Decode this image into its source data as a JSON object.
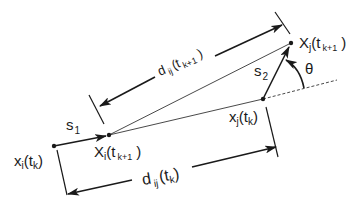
{
  "diagram": {
    "colors": {
      "stroke": "#1a1a1a",
      "background": "#ffffff"
    },
    "points": {
      "xi_tk": {
        "label_main": "x",
        "label_sub": "i",
        "label_arg": "(t",
        "label_arg_sub": "k",
        "label_close": ")"
      },
      "Xi_tk1": {
        "label_main": "X",
        "label_sub": "i",
        "label_arg": "(t",
        "label_arg_sub": "k+1",
        "label_close": " )"
      },
      "Xj_tk1": {
        "label_main": "X",
        "label_sub": "j",
        "label_arg": "(t",
        "label_arg_sub": "k+1",
        "label_close": " )"
      },
      "xj_tk": {
        "label_main": "x",
        "label_sub": "j",
        "label_arg": "(t",
        "label_arg_sub": "k",
        "label_close": ")"
      }
    },
    "vectors": {
      "s1": {
        "label_main": "s",
        "label_sub": "1"
      },
      "s2": {
        "label_main": "s",
        "label_sub": "2"
      }
    },
    "distances": {
      "d_tk1": {
        "label_main": "d",
        "label_sub": "ij",
        "label_arg": "(t",
        "label_arg_sub": "k+1",
        "label_close": " )"
      },
      "d_tk": {
        "label_main": "d",
        "label_sub": "ij",
        "label_arg": "(t",
        "label_arg_sub": "k",
        "label_close": ")"
      }
    },
    "angle": {
      "label": "θ"
    }
  }
}
